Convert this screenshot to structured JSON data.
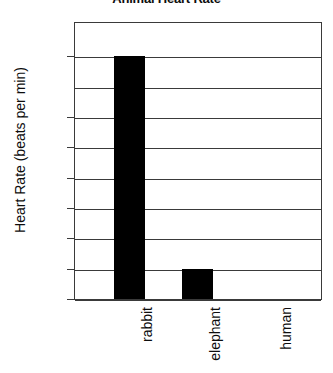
{
  "chart_data": {
    "type": "bar",
    "title": "Animal Heart Rate",
    "xlabel": "",
    "ylabel": "Heart Rate (beats per min)",
    "categories": [
      "rabbit",
      "elephant",
      "human"
    ],
    "values": [
      200,
      25,
      0
    ],
    "ylim": [
      0,
      225
    ],
    "ytick_labels": [
      "200",
      "150",
      "125",
      "100",
      "75",
      "50",
      "25",
      "0"
    ],
    "ytick_values": [
      200,
      150,
      125,
      100,
      75,
      50,
      25,
      0
    ],
    "gridline_count": 9,
    "grid": true,
    "legend": "none",
    "bar_color": "#000000",
    "frame_color": "#3a3a3a",
    "background_color": "#ffffff"
  }
}
